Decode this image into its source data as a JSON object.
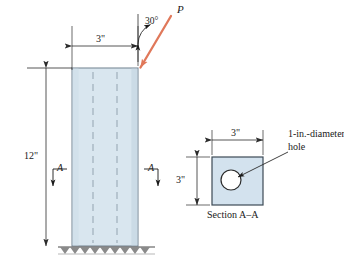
{
  "figure": {
    "type": "engineering-mechanics-diagram"
  },
  "colors": {
    "member_fill": "#d9e6ef",
    "member_edge": "#6f7f8c",
    "force_arrow": "#e0785a",
    "line": "#2b2b2b",
    "hidden_line": "#9aa7b2",
    "hole_fill": "#ffffff",
    "ground": "#4a4a4a",
    "text": "#1a1a1a"
  },
  "elevation": {
    "name": "column-elevation-view",
    "load": {
      "label": "P",
      "angle_label": "30°",
      "angle_value_deg": 30,
      "angle_reference": "vertical",
      "application_point": "top-right-corner-of-column"
    },
    "dimensions": [
      {
        "id": "width",
        "label": "3\"",
        "value": 3,
        "unit": "in",
        "orientation": "horizontal",
        "location": "above-column-top"
      },
      {
        "id": "height",
        "label": "12\"",
        "value": 12,
        "unit": "in",
        "orientation": "vertical",
        "location": "left-of-column"
      }
    ],
    "section_markers": [
      {
        "id": "section-marker-left",
        "label": "A",
        "side": "left",
        "arrow_direction": "down"
      },
      {
        "id": "section-marker-right",
        "label": "A",
        "side": "right",
        "arrow_direction": "down"
      }
    ],
    "hidden_lines": {
      "count": 2,
      "meaning": "hidden edges of the internal 1-in.-diameter hole"
    },
    "support": {
      "type": "fixed-base",
      "hatching": "ground-hatch"
    }
  },
  "section": {
    "name": "section-a-a-view",
    "caption": "Section A–A",
    "dimensions": [
      {
        "id": "section-width",
        "label": "3\"",
        "value": 3,
        "unit": "in",
        "orientation": "horizontal",
        "location": "above-section"
      },
      {
        "id": "section-depth",
        "label": "3\"",
        "value": 3,
        "unit": "in",
        "orientation": "vertical",
        "location": "left-of-section"
      }
    ],
    "hole": {
      "annotation_line_1": "1-in.-diameter",
      "annotation_line_2": "hole",
      "diameter": 1,
      "unit": "in",
      "shape": "circle"
    }
  }
}
